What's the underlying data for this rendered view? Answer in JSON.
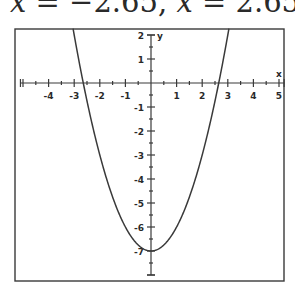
{
  "caption": {
    "text": "x = −2.65,  x = 2.65",
    "parts": [
      {
        "var": "x",
        "rel": " = −2.65, "
      },
      {
        "var": "x",
        "rel": " = 2.65"
      }
    ]
  },
  "chart_data": {
    "type": "line",
    "title": "",
    "function": "y = x^2 - 7",
    "xlabel": "x",
    "ylabel": "y",
    "xlim": [
      -5.1,
      5.2
    ],
    "ylim": [
      -8,
      2.25
    ],
    "x_ticks": [
      -4,
      -3,
      -2,
      -1,
      1,
      2,
      3,
      4,
      5
    ],
    "y_ticks": [
      2,
      1,
      -1,
      -2,
      -3,
      -4,
      -5,
      -6,
      -7
    ],
    "minor_tick_step": 0.5,
    "grid": false,
    "legend": null,
    "series": [
      {
        "name": "y = x^2 - 7",
        "x": [
          -3.0,
          -2.65,
          -2,
          -1,
          0,
          1,
          2,
          2.65,
          3.0
        ],
        "y": [
          2,
          0,
          -3,
          -6,
          -7,
          -6,
          -3,
          0,
          2
        ]
      }
    ],
    "annotations": [
      "x-intercepts at x = -2.65 and x = 2.65",
      "minimum at (0, -7)"
    ]
  },
  "style": {
    "stroke": "#3a3a3a",
    "text": "#2a2a2a",
    "background": "#ffffff"
  },
  "layout": {
    "frame": {
      "x0": 15,
      "y0": 29,
      "x1": 284,
      "y1": 281
    },
    "origin": {
      "px": 151,
      "py": 83
    },
    "unit_x": 25.6,
    "unit_y": 24
  }
}
